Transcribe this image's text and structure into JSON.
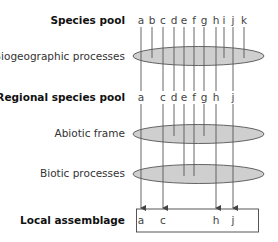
{
  "diagram": {
    "title": "",
    "levels": {
      "species_pool": {
        "label": "Species pool",
        "species": [
          "a",
          "b",
          "c",
          "d",
          "e",
          "f",
          "g",
          "h",
          "i",
          "j",
          "k"
        ]
      },
      "biogeographic": {
        "label": "Biogeographic processes"
      },
      "regional_pool": {
        "label": "Regional species pool",
        "species": [
          "a",
          "c",
          "d",
          "e",
          "f",
          "g",
          "h",
          "j"
        ]
      },
      "abiotic": {
        "label": "Abiotic frame"
      },
      "biotic": {
        "label": "Biotic processes"
      },
      "local_assemblage": {
        "label": "Local assemblage",
        "species": [
          "a",
          "c",
          "h",
          "j"
        ]
      }
    },
    "species_x": {
      "a": 141,
      "b": 152,
      "c": 163,
      "d": 174,
      "e": 184,
      "f": 194,
      "g": 204,
      "h": 216,
      "i": 224,
      "j": 233,
      "k": 244
    },
    "filters": [
      {
        "name": "Biogeographic processes",
        "removed": [
          "b",
          "i",
          "k"
        ]
      },
      {
        "name": "Abiotic frame",
        "removed": [
          "d",
          "g"
        ]
      },
      {
        "name": "Biotic processes",
        "removed": [
          "e",
          "f"
        ]
      }
    ],
    "colors": {
      "ellipse_fill": "#cfcfcf",
      "line": "#555555"
    }
  }
}
